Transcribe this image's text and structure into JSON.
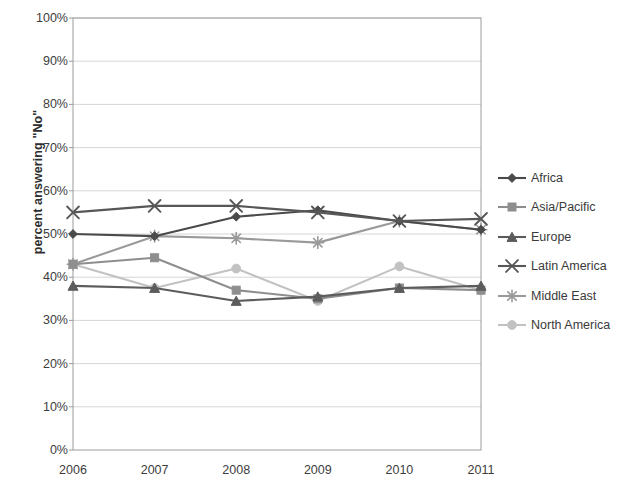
{
  "chart_data": {
    "type": "line",
    "title": "",
    "xlabel": "",
    "ylabel": "percent answering \"No\"",
    "categories": [
      "2006",
      "2007",
      "2008",
      "2009",
      "2010",
      "2011"
    ],
    "x": [
      2006,
      2007,
      2008,
      2009,
      2010,
      2011
    ],
    "ylim": [
      0,
      100
    ],
    "ytick_labels": [
      "0%",
      "10%",
      "20%",
      "30%",
      "40%",
      "50%",
      "60%",
      "70%",
      "80%",
      "90%",
      "100%"
    ],
    "ytick_values": [
      0,
      10,
      20,
      30,
      40,
      50,
      60,
      70,
      80,
      90,
      100
    ],
    "y_unit": "%",
    "grid": "horizontal",
    "legend_position": "right",
    "series": [
      {
        "name": "Africa",
        "marker": "diamond",
        "color": "#4a4a4a",
        "values": [
          50,
          49.5,
          54,
          55.5,
          53,
          51
        ]
      },
      {
        "name": "Asia/Pacific",
        "marker": "square",
        "color": "#8e8e8e",
        "values": [
          43,
          44.5,
          37,
          35,
          37.5,
          37
        ]
      },
      {
        "name": "Europe",
        "marker": "triangle",
        "color": "#5c5c5c",
        "values": [
          38,
          37.5,
          34.5,
          35.5,
          37.5,
          38
        ]
      },
      {
        "name": "Latin America",
        "marker": "x",
        "color": "#575757",
        "values": [
          55,
          56.5,
          56.5,
          55,
          53,
          53.5
        ]
      },
      {
        "name": "Middle East",
        "marker": "star",
        "color": "#9a9a9a",
        "values": [
          43,
          49.5,
          49,
          48,
          53,
          51
        ]
      },
      {
        "name": "North America",
        "marker": "circle",
        "color": "#c2c2c2",
        "values": [
          43,
          37.5,
          42,
          34.5,
          42.5,
          37
        ]
      }
    ]
  },
  "axis": {
    "frame_color": "#9c9c9c",
    "grid_color": "#d6d6d6"
  }
}
